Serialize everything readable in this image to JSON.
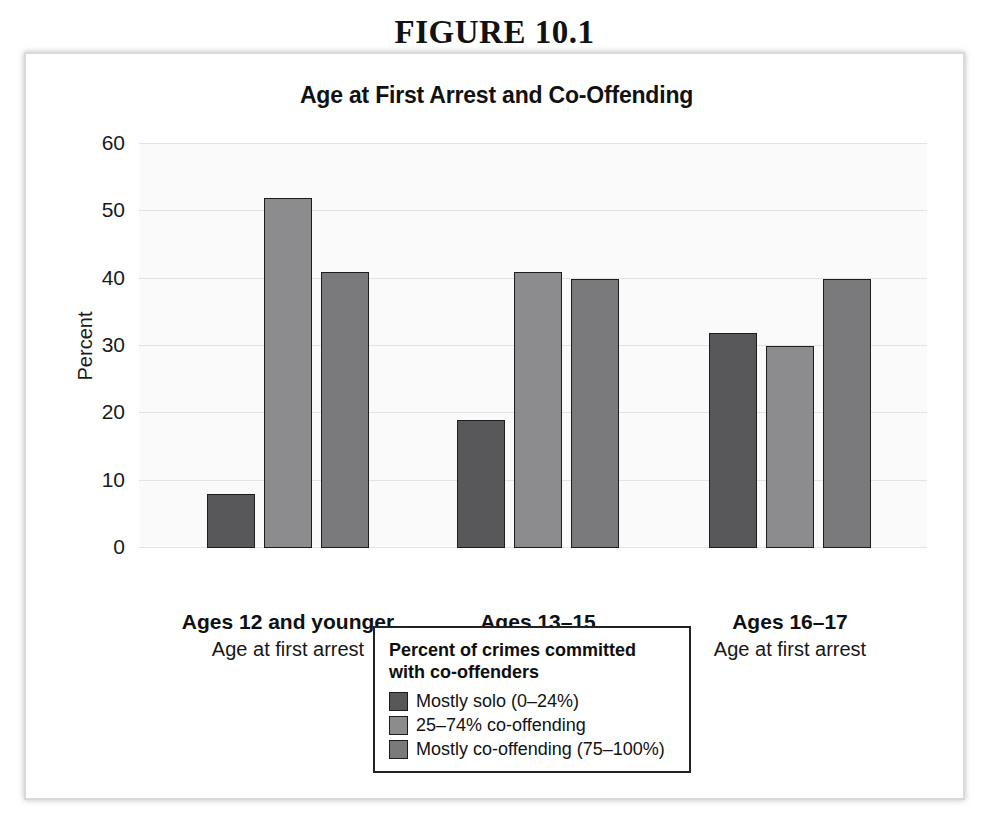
{
  "figure": {
    "number_label": "FIGURE 10.1"
  },
  "chart_data": {
    "type": "bar",
    "title": "Age at First Arrest and Co-Offending",
    "xlabel": "Age at first arrest",
    "ylabel": "Percent",
    "ylim": [
      0,
      60
    ],
    "yticks": [
      0,
      10,
      20,
      30,
      40,
      50,
      60
    ],
    "ytick_labels": [
      "0",
      "10",
      "20",
      "30",
      "40",
      "50",
      "60"
    ],
    "grid": true,
    "legend_position": "below-center",
    "legend_title": "Percent of crimes committed\nwith co-offenders",
    "categories": [
      "Ages 12 and younger",
      "Ages 13–15",
      "Ages 16–17"
    ],
    "category_sublabels": [
      "Age at first arrest",
      "Age at first arrest",
      "Age at first arrest"
    ],
    "series": [
      {
        "name": "Mostly solo (0–24%)",
        "color": "#58585a",
        "values": [
          8,
          19,
          32
        ]
      },
      {
        "name": "25–74% co-offending",
        "color": "#8c8c8e",
        "values": [
          52,
          41,
          30
        ]
      },
      {
        "name": "Mostly co-offending (75–100%)",
        "color": "#7a7a7c",
        "values": [
          41,
          40,
          40
        ]
      }
    ]
  },
  "colors": {
    "bar_outline": "#1d1d1d",
    "gridline": "#e3e3e3",
    "plot_background": "#fafafa",
    "panel_border": "#d9d9d9"
  }
}
